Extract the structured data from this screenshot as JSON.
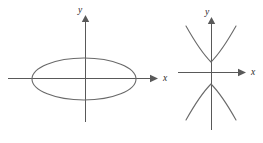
{
  "figure": {
    "title": "",
    "background_color": "#ffffff",
    "curve_color": "#6a6a6a",
    "axis_color": "#595959",
    "label_color": "#2b2b2b",
    "panels": [
      {
        "id": "ellipse-panel",
        "name": "ellipse-graph",
        "curve_type": "ellipse",
        "x_axis_label": "x",
        "y_axis_label": "y",
        "origin": {
          "x": 85,
          "y": 78
        },
        "x_axis": {
          "start_x": 8,
          "end_x": 150,
          "arrow_tip_x": 158
        },
        "y_axis": {
          "top_y": 22,
          "bottom_y": 122,
          "arrow_tip_y": 15
        },
        "ellipse": {
          "cx": 84,
          "cy": 79,
          "rx": 52,
          "ry": 21
        }
      },
      {
        "id": "hyperbola-panel",
        "name": "hyperbola-graph",
        "curve_type": "hyperbola",
        "x_axis_label": "x",
        "y_axis_label": "y",
        "origin": {
          "x": 211,
          "y": 72
        },
        "x_axis": {
          "start_x": 178,
          "end_x": 238,
          "arrow_tip_x": 246
        },
        "y_axis": {
          "top_y": 24,
          "bottom_y": 130,
          "arrow_tip_y": 17
        },
        "upper_branch": {
          "vertex_x": 211,
          "vertex_y": 62,
          "left_end_x": 186,
          "left_end_y": 26,
          "right_end_x": 236,
          "right_end_y": 26
        },
        "lower_branch": {
          "vertex_x": 211,
          "vertex_y": 84,
          "left_end_x": 186,
          "left_end_y": 120,
          "right_end_x": 236,
          "right_end_y": 120
        }
      }
    ]
  }
}
